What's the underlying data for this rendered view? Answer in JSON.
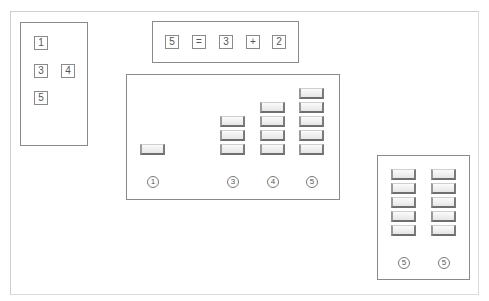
{
  "left_panel": {
    "numbers": [
      "1",
      "3",
      "4",
      "5"
    ]
  },
  "equation": {
    "tokens": [
      "5",
      "=",
      "3",
      "+",
      "2"
    ]
  },
  "center_panel": {
    "columns": [
      {
        "count": 1,
        "label": "1"
      },
      {
        "count": 3,
        "label": "3"
      },
      {
        "count": 4,
        "label": "4"
      },
      {
        "count": 5,
        "label": "5"
      }
    ]
  },
  "right_panel": {
    "columns": [
      {
        "count": 5,
        "label": "5"
      },
      {
        "count": 5,
        "label": "5"
      }
    ]
  },
  "colors": {
    "border": "#8a8a8a",
    "block_fill": "#eeeeee",
    "block_shadow": "#6f6f6f"
  }
}
